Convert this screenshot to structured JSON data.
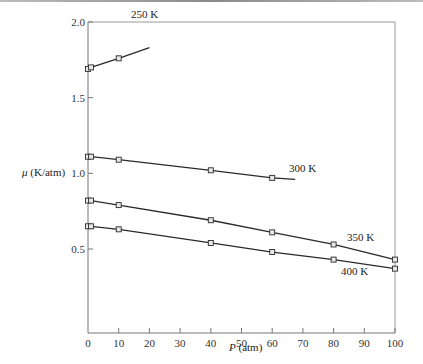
{
  "chart_data": {
    "type": "line",
    "title": "",
    "xlabel": "P (atm)",
    "ylabel": "μ (K/atm)",
    "xlim": [
      0,
      100
    ],
    "ylim": [
      0.0,
      2.0
    ],
    "x_ticks": [
      0,
      10,
      20,
      30,
      40,
      50,
      60,
      70,
      80,
      90,
      100
    ],
    "y_ticks": [
      0.5,
      1.0,
      1.5,
      2.0
    ],
    "x_tick_labels": [
      "0",
      "10",
      "20",
      "30",
      "40",
      "50",
      "60",
      "70",
      "80",
      "90",
      "100"
    ],
    "y_tick_labels": [
      "0.5",
      "1.0",
      "1.5",
      "2.0"
    ],
    "grid": false,
    "legend": "inline labels",
    "marker": "square",
    "series": [
      {
        "name": "250 K",
        "points": [
          [
            0,
            1.69
          ],
          [
            1,
            1.7
          ],
          [
            10,
            1.76
          ]
        ],
        "line_end": [
          20,
          1.83
        ],
        "label_pos": [
          17,
          1.93
        ]
      },
      {
        "name": "300 K",
        "points": [
          [
            0,
            1.11
          ],
          [
            1,
            1.11
          ],
          [
            10,
            1.09
          ],
          [
            40,
            1.02
          ],
          [
            60,
            0.97
          ]
        ],
        "line_end": [
          67.5,
          0.96
        ],
        "label_pos": [
          65,
          0.98
        ]
      },
      {
        "name": "350 K",
        "points": [
          [
            0,
            0.82
          ],
          [
            1,
            0.82
          ],
          [
            10,
            0.79
          ],
          [
            40,
            0.69
          ],
          [
            60,
            0.61
          ],
          [
            80,
            0.53
          ],
          [
            100,
            0.43
          ]
        ],
        "line_end": [
          100,
          0.43
        ],
        "label_pos": [
          84,
          0.53
        ]
      },
      {
        "name": "400 K",
        "points": [
          [
            0,
            0.65
          ],
          [
            1,
            0.65
          ],
          [
            10,
            0.63
          ],
          [
            40,
            0.54
          ],
          [
            60,
            0.48
          ],
          [
            80,
            0.43
          ],
          [
            100,
            0.37
          ]
        ],
        "line_end": [
          100,
          0.37
        ],
        "label_pos": [
          82,
          0.31
        ]
      }
    ]
  },
  "labels": {
    "ylabel_symbol": "μ",
    "ylabel_unit": " (K/atm)",
    "xlabel_symbol": "P",
    "xlabel_unit": " (atm)",
    "series_250": "250 K",
    "series_300": "300 K",
    "series_350": "350 K",
    "series_400": "400 K"
  }
}
